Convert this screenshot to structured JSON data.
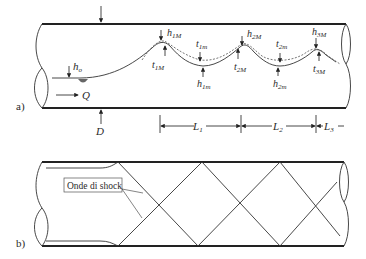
{
  "panel_a": {
    "label": "a)",
    "h_o": {
      "base": "h",
      "sub": "o"
    },
    "Q": "Q",
    "D": "D",
    "peaks": [
      {
        "h": {
          "base": "h",
          "sub": "1M"
        },
        "t": {
          "base": "t",
          "sub": "1M"
        }
      },
      {
        "h": {
          "base": "h",
          "sub": "2M"
        },
        "t": {
          "base": "t",
          "sub": "2M"
        }
      },
      {
        "h": {
          "base": "h",
          "sub": "3M"
        },
        "t": {
          "base": "t",
          "sub": "3M"
        }
      }
    ],
    "troughs": [
      {
        "h": {
          "base": "h",
          "sub": "1m"
        },
        "t": {
          "base": "t",
          "sub": "1m"
        }
      },
      {
        "h": {
          "base": "h",
          "sub": "2m"
        },
        "t": {
          "base": "t",
          "sub": "2m"
        }
      }
    ],
    "lengths": [
      {
        "base": "L",
        "sub": "1"
      },
      {
        "base": "L",
        "sub": "2"
      },
      {
        "base": "L",
        "sub": "3"
      }
    ]
  },
  "panel_b": {
    "label": "b)",
    "shock_label": "Onde di shock"
  }
}
